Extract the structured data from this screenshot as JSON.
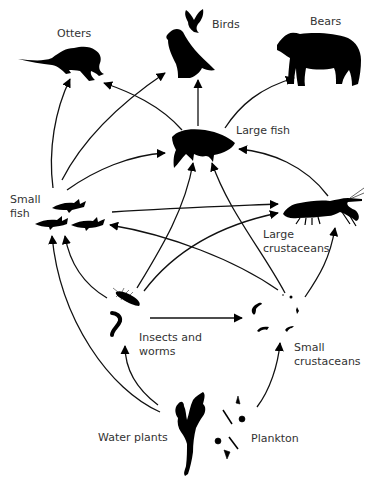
{
  "diagram": {
    "type": "food-web",
    "nodes": [
      {
        "id": "otters",
        "label": "Otters",
        "icon": "otter-icon"
      },
      {
        "id": "birds",
        "label": "Birds",
        "icon": "bird-icon"
      },
      {
        "id": "bears",
        "label": "Bears",
        "icon": "bear-icon"
      },
      {
        "id": "large_fish",
        "label": "Large fish",
        "icon": "large-fish-icon"
      },
      {
        "id": "small_fish",
        "label": "Small\nfish",
        "icon": "small-fish-icon"
      },
      {
        "id": "large_crustaceans",
        "label": "Large\ncrustaceans",
        "icon": "crayfish-icon"
      },
      {
        "id": "insects_worms",
        "label": "Insects and\nworms",
        "icon": "insect-worm-icon"
      },
      {
        "id": "small_crustaceans",
        "label": "Small\ncrustaceans",
        "icon": "small-crustacean-icon"
      },
      {
        "id": "water_plants",
        "label": "Water plants",
        "icon": "water-plant-icon"
      },
      {
        "id": "plankton",
        "label": "Plankton",
        "icon": "plankton-icon"
      }
    ],
    "edges": [
      {
        "from": "small_fish",
        "to": "otters"
      },
      {
        "from": "large_fish",
        "to": "otters"
      },
      {
        "from": "small_fish",
        "to": "birds"
      },
      {
        "from": "large_fish",
        "to": "birds"
      },
      {
        "from": "large_fish",
        "to": "bears"
      },
      {
        "from": "small_fish",
        "to": "large_fish"
      },
      {
        "from": "large_crustaceans",
        "to": "large_fish"
      },
      {
        "from": "insects_worms",
        "to": "large_fish"
      },
      {
        "from": "small_crustaceans",
        "to": "large_fish"
      },
      {
        "from": "small_fish",
        "to": "large_crustaceans"
      },
      {
        "from": "insects_worms",
        "to": "large_crustaceans"
      },
      {
        "from": "small_crustaceans",
        "to": "large_crustaceans"
      },
      {
        "from": "small_crustaceans",
        "to": "small_fish"
      },
      {
        "from": "insects_worms",
        "to": "small_fish"
      },
      {
        "from": "water_plants",
        "to": "small_fish"
      },
      {
        "from": "insects_worms",
        "to": "small_crustaceans"
      },
      {
        "from": "water_plants",
        "to": "insects_worms"
      },
      {
        "from": "plankton",
        "to": "small_crustaceans"
      }
    ]
  },
  "labels": {
    "otters": "Otters",
    "birds": "Birds",
    "bears": "Bears",
    "large_fish": "Large fish",
    "small_fish_1": "Small",
    "small_fish_2": "fish",
    "large_crustaceans_1": "Large",
    "large_crustaceans_2": "crustaceans",
    "insects_1": "Insects and",
    "insects_2": "worms",
    "small_crustaceans_1": "Small",
    "small_crustaceans_2": "crustaceans",
    "water_plants": "Water plants",
    "plankton": "Plankton"
  },
  "colors": {
    "ink": "#000000",
    "text": "#333333",
    "background": "#ffffff"
  }
}
